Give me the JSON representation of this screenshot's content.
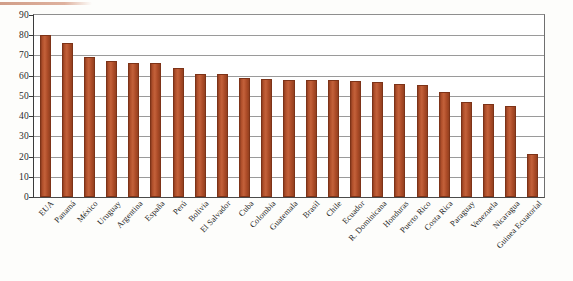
{
  "figure": {
    "background_color": "#ffffff",
    "bar_color": "#b2512c",
    "gridline_color": "#9a9a9a",
    "axis_color": "#3b3b3b",
    "artifact_line_color": "#c98d74"
  },
  "chart_data": {
    "type": "bar",
    "title": "",
    "subtitle": "",
    "xlabel": "",
    "ylabel": "",
    "ylim": [
      0,
      90
    ],
    "yticks": [
      0,
      10,
      20,
      30,
      40,
      50,
      60,
      70,
      80,
      90
    ],
    "grid": true,
    "legend": null,
    "legend_position": "none",
    "categories": [
      "EUA",
      "Panamá",
      "México",
      "Uruguay",
      "Argentina",
      "España",
      "Perú",
      "Bolivia",
      "El Salvador",
      "Cuba",
      "Colombia",
      "Guatemala",
      "Brasil",
      "Chile",
      "Ecuador",
      "R. Dominicana",
      "Honduras",
      "Puerto Rico",
      "Costa Rica",
      "Paraguay",
      "Venezuela",
      "Nicaragua",
      "Guinea Ecuatorial"
    ],
    "values": [
      80,
      76,
      69,
      67.5,
      66.5,
      66.5,
      64,
      61,
      61,
      59,
      58.5,
      58,
      58,
      58,
      57.5,
      57,
      56,
      55.5,
      52,
      47,
      46,
      45,
      21.5
    ]
  }
}
